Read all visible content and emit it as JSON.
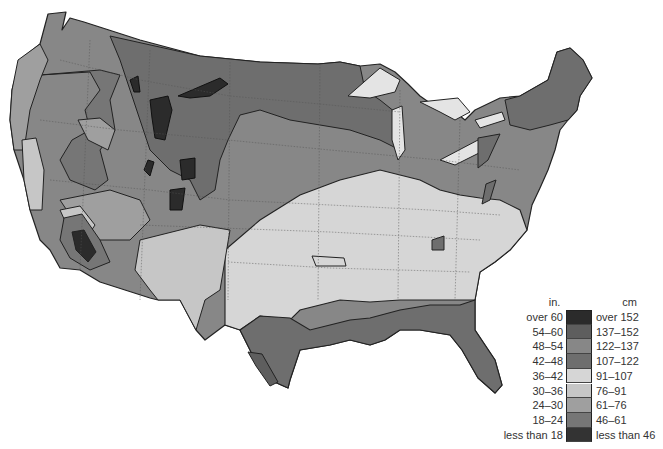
{
  "caption_fragment": "",
  "legend": {
    "unit_left": "in.",
    "unit_right": "cm",
    "items": [
      {
        "in": "over 60",
        "cm": "over 152",
        "color": "#2b2b2b"
      },
      {
        "in": "54–60",
        "cm": "137–152",
        "color": "#5e5e5e"
      },
      {
        "in": "48–54",
        "cm": "122–137",
        "color": "#878787"
      },
      {
        "in": "42–48",
        "cm": "107–122",
        "color": "#6e6e6e"
      },
      {
        "in": "36–42",
        "cm": "91–107",
        "color": "#d6d6d6"
      },
      {
        "in": "30–36",
        "cm": "76–91",
        "color": "#c6c6c6"
      },
      {
        "in": "24–30",
        "cm": "61–76",
        "color": "#9f9f9f"
      },
      {
        "in": "18–24",
        "cm": "46–61",
        "color": "#767676"
      },
      {
        "in": "less than 18",
        "cm": "less than 46",
        "color": "#333333"
      }
    ]
  },
  "map_zones": {
    "northern_plains": "#6e6e6e",
    "rockies_dark": "#2b2b2b",
    "great_basin": "#767676",
    "west_light": "#9f9f9f",
    "central_band": "#878787",
    "south_light": "#d6d6d6",
    "gulf_coast": "#6e6e6e",
    "northeast": "#6e6e6e",
    "great_lakes": "#e4e4e4",
    "california_light": "#c6c6c6"
  }
}
